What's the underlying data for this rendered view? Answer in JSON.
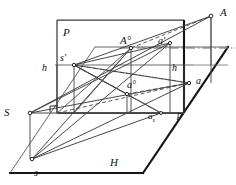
{
  "diagram": {
    "type": "line-diagram",
    "colors": {
      "stroke": "#2b2b2b",
      "thin_stroke": "#555555",
      "heavy_stroke": "#111111",
      "background": "#ffffff",
      "label": "#111111"
    },
    "planes": [
      {
        "name": "vertical-plane",
        "label": "P"
      },
      {
        "name": "horizontal-plane",
        "label": "H"
      }
    ],
    "ground_line": {
      "name": "ground-line",
      "label": "p"
    },
    "labels": [
      {
        "name": "label-plane-P",
        "text": "P",
        "x": 63,
        "y": 27,
        "size": "cap"
      },
      {
        "name": "label-plane-H",
        "text": "H",
        "x": 110,
        "y": 157,
        "size": "cap"
      },
      {
        "name": "label-point-A",
        "text": "A",
        "x": 220,
        "y": 7,
        "size": "cap"
      },
      {
        "name": "label-point-A0",
        "text": "A°",
        "x": 120,
        "y": 35,
        "size": "cap"
      },
      {
        "name": "label-point-a1",
        "text": "a'",
        "x": 158,
        "y": 36,
        "size": "low"
      },
      {
        "name": "label-point-a0",
        "text": "a°",
        "x": 127,
        "y": 80,
        "size": "low"
      },
      {
        "name": "label-point-a",
        "text": "a",
        "x": 196,
        "y": 76,
        "size": "low"
      },
      {
        "name": "label-point-ax",
        "text": "ax",
        "x": 148,
        "y": 112,
        "size": "sm"
      },
      {
        "name": "label-point-S",
        "text": "S",
        "x": 4,
        "y": 107,
        "size": "cap"
      },
      {
        "name": "label-point-s1",
        "text": "s'",
        "x": 60,
        "y": 53,
        "size": "low"
      },
      {
        "name": "label-point-s",
        "text": "s",
        "x": 34,
        "y": 168,
        "size": "low"
      },
      {
        "name": "label-height-left",
        "text": "h",
        "x": 42,
        "y": 63,
        "size": "low"
      },
      {
        "name": "label-height-right",
        "text": "h",
        "x": 172,
        "y": 63,
        "size": "low"
      },
      {
        "name": "label-ground-p",
        "text": "p",
        "x": 177,
        "y": 110,
        "size": "low"
      }
    ],
    "points": [
      {
        "name": "point-A",
        "x": 211,
        "y": 16
      },
      {
        "name": "point-A0",
        "x": 131,
        "y": 48
      },
      {
        "name": "point-a1",
        "x": 170,
        "y": 43
      },
      {
        "name": "point-a0",
        "x": 127,
        "y": 94
      },
      {
        "name": "point-a",
        "x": 189,
        "y": 83
      },
      {
        "name": "point-ax",
        "x": 161,
        "y": 113
      },
      {
        "name": "point-S",
        "x": 30,
        "y": 113
      },
      {
        "name": "point-s1",
        "x": 74,
        "y": 65
      },
      {
        "name": "point-s",
        "x": 32,
        "y": 159
      }
    ]
  }
}
